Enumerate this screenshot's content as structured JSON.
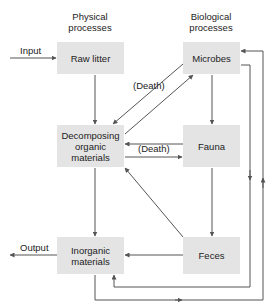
{
  "headers": {
    "physical": "Physical processes",
    "biological": "Biological processes"
  },
  "nodes": {
    "raw_litter": "Raw litter",
    "microbes": "Microbes",
    "decomposing": "Decomposing organic materials",
    "fauna": "Fauna",
    "inorganic": "Inorganic materials",
    "feces": "Feces"
  },
  "labels": {
    "input": "Input",
    "output": "Output",
    "death_microbes": "(Death)",
    "death_fauna": "(Death)"
  },
  "colors": {
    "box_fill": "#e4e4e4",
    "line": "#555555"
  }
}
